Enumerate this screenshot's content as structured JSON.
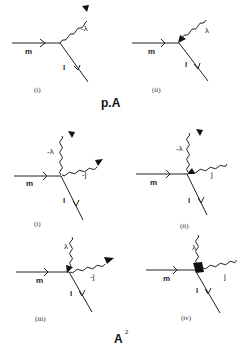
{
  "groups": [
    {
      "title": "p.A",
      "title_superscript": "",
      "diagrams": [
        {
          "caption": "(i)",
          "fermion_in": "m",
          "fermion_out": "l",
          "photons": [
            {
              "label": "-λ",
              "direction": "outgoing",
              "position": "upper-right"
            }
          ]
        },
        {
          "caption": "(ii)",
          "fermion_in": "m",
          "fermion_out": "l",
          "photons": [
            {
              "label": "λ",
              "direction": "incoming",
              "position": "upper-right"
            }
          ]
        }
      ]
    },
    {
      "title": "A",
      "title_superscript": "2",
      "diagrams": [
        {
          "caption": "(i)",
          "fermion_in": "m",
          "fermion_out": "l",
          "photons": [
            {
              "label": "-λ",
              "direction": "outgoing",
              "position": "up"
            },
            {
              "label": "-j",
              "direction": "outgoing",
              "position": "right"
            }
          ]
        },
        {
          "caption": "(ii)",
          "fermion_in": "m",
          "fermion_out": "l",
          "photons": [
            {
              "label": "-λ",
              "direction": "outgoing",
              "position": "up"
            },
            {
              "label": "j",
              "direction": "incoming",
              "position": "right"
            }
          ]
        },
        {
          "caption": "(iii)",
          "fermion_in": "m",
          "fermion_out": "l",
          "photons": [
            {
              "label": "λ",
              "direction": "incoming",
              "position": "up"
            },
            {
              "label": "-j",
              "direction": "outgoing",
              "position": "right"
            }
          ]
        },
        {
          "caption": "(iv)",
          "fermion_in": "m",
          "fermion_out": "l",
          "photons": [
            {
              "label": "λ",
              "direction": "incoming",
              "position": "up"
            },
            {
              "label": "j",
              "direction": "incoming",
              "position": "right"
            }
          ]
        }
      ]
    }
  ]
}
